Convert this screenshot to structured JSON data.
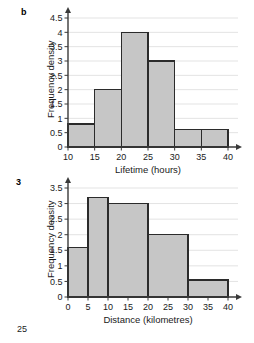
{
  "page": {
    "page_number": "25",
    "background": "#ffffff"
  },
  "figures": [
    {
      "key": "b",
      "label": "b",
      "chart_data": {
        "type": "bar",
        "title": "",
        "xlabel": "Lifetime (hours)",
        "ylabel": "Frequency density",
        "xlim": [
          10,
          40
        ],
        "ylim": [
          0,
          4.5
        ],
        "xticks": [
          "10",
          "15",
          "20",
          "25",
          "30",
          "35",
          "40"
        ],
        "xtick_values": [
          10,
          15,
          20,
          25,
          30,
          35,
          40
        ],
        "yticks": [
          "0",
          "0.5",
          "1",
          "1.5",
          "2",
          "2.5",
          "3",
          "3.5",
          "4",
          "4.5"
        ],
        "ytick_values": [
          0,
          0.5,
          1,
          1.5,
          2,
          2.5,
          3,
          3.5,
          4,
          4.5
        ],
        "grid": true,
        "legend": "none",
        "bars": [
          {
            "x0": 10,
            "x1": 15,
            "height": 0.8
          },
          {
            "x0": 15,
            "x1": 20,
            "height": 2.0
          },
          {
            "x0": 20,
            "x1": 25,
            "height": 4.0
          },
          {
            "x0": 25,
            "x1": 30,
            "height": 3.0
          },
          {
            "x0": 30,
            "x1": 35,
            "height": 0.6
          },
          {
            "x0": 35,
            "x1": 40,
            "height": 0.6
          }
        ]
      }
    },
    {
      "key": "3",
      "label": "3",
      "chart_data": {
        "type": "bar",
        "title": "",
        "xlabel": "Distance (kilometres)",
        "ylabel": "Frequency density",
        "xlim": [
          0,
          40
        ],
        "ylim": [
          0,
          3.5
        ],
        "xticks": [
          "0",
          "5",
          "10",
          "15",
          "20",
          "25",
          "30",
          "35",
          "40"
        ],
        "xtick_values": [
          0,
          5,
          10,
          15,
          20,
          25,
          30,
          35,
          40
        ],
        "yticks": [
          "0",
          "0.5",
          "1",
          "1.5",
          "2",
          "2.5",
          "3",
          "3.5"
        ],
        "ytick_values": [
          0,
          0.5,
          1,
          1.5,
          2,
          2.5,
          3,
          3.5
        ],
        "grid": true,
        "legend": "none",
        "bars": [
          {
            "x0": 0,
            "x1": 5,
            "height": 1.6
          },
          {
            "x0": 5,
            "x1": 10,
            "height": 3.2
          },
          {
            "x0": 10,
            "x1": 20,
            "height": 3.0
          },
          {
            "x0": 20,
            "x1": 30,
            "height": 2.0
          },
          {
            "x0": 30,
            "x1": 40,
            "height": 0.55
          }
        ]
      }
    }
  ],
  "style": {
    "bar_fill": "#c6c6c6",
    "bar_stroke": "#2b2b2b",
    "axis_color": "#3a3a3a",
    "grid_color": "#e3e3e3",
    "text_color": "#1a1a1a"
  }
}
